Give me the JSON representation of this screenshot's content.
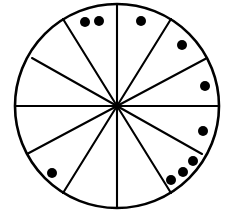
{
  "figure": {
    "title": "Circle divided into twelve sectors with nine dots",
    "type": "geometric-diagram",
    "background_color": "#ffffff",
    "stroke_color": "#000000",
    "dot_color": "#000000"
  },
  "circle": {
    "label": "circle-outline",
    "center_x": 117,
    "center_y": 106,
    "radius": 102,
    "stroke_width": 2.6,
    "fill": "#ffffff"
  },
  "sectors": {
    "count": 12,
    "divider_count": 6,
    "description": "Six diameters through the center create twelve wedge sectors"
  },
  "dividers": [
    {
      "name": "divider-vertical",
      "angle_deg": 90,
      "x1": 117,
      "y1": 4,
      "x2": 117,
      "y2": 208
    },
    {
      "name": "divider-horizontal",
      "angle_deg": 0,
      "x1": 15,
      "y1": 106,
      "x2": 219,
      "y2": 106
    },
    {
      "name": "divider-upper-left-a",
      "angle_deg": 122,
      "x1": 63,
      "y1": 19,
      "x2": 171,
      "y2": 193
    },
    {
      "name": "divider-upper-left-b",
      "angle_deg": 152,
      "x1": 32,
      "y1": 58,
      "x2": 202,
      "y2": 154
    },
    {
      "name": "divider-upper-right-a",
      "angle_deg": 58,
      "x1": 171,
      "y1": 19,
      "x2": 63,
      "y2": 193
    },
    {
      "name": "divider-upper-right-b",
      "angle_deg": 28,
      "x1": 207,
      "y1": 58,
      "x2": 27,
      "y2": 154
    }
  ],
  "dots": {
    "count": 9,
    "radius": 5,
    "items": [
      {
        "name": "dot-1",
        "x": 85,
        "y": 22,
        "sector": "top-left-1"
      },
      {
        "name": "dot-2",
        "x": 99,
        "y": 21,
        "sector": "top-left-1"
      },
      {
        "name": "dot-3",
        "x": 141,
        "y": 21,
        "sector": "top-right-1"
      },
      {
        "name": "dot-4",
        "x": 182,
        "y": 45,
        "sector": "upper-right-2"
      },
      {
        "name": "dot-5",
        "x": 205,
        "y": 86,
        "sector": "right-upper-3"
      },
      {
        "name": "dot-6",
        "x": 203,
        "y": 131,
        "sector": "right-lower-4"
      },
      {
        "name": "dot-7",
        "x": 193,
        "y": 161,
        "sector": "lower-right-5"
      },
      {
        "name": "dot-8",
        "x": 183,
        "y": 172,
        "sector": "lower-right-6"
      },
      {
        "name": "dot-9",
        "x": 171,
        "y": 180,
        "sector": "lower-right-6"
      },
      {
        "name": "dot-10",
        "x": 52,
        "y": 173,
        "sector": "lower-left-7"
      }
    ]
  }
}
